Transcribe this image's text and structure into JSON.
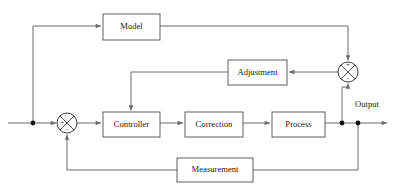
{
  "diagram": {
    "canvas": {
      "width": 399,
      "height": 195,
      "background": "#ffffff"
    },
    "colors": {
      "wire": "#6a6a6a",
      "box_stroke": "#4d4d4d",
      "box_fill": "#ffffff",
      "text": "#1a1a1a",
      "junction_dot": "#111111",
      "circle_stroke": "#3d3d3d"
    },
    "blocks": [
      {
        "id": "model",
        "label": "Model",
        "x": 103,
        "y": 14,
        "w": 57,
        "h": 26
      },
      {
        "id": "adjustment",
        "label": "Adjustment",
        "x": 228,
        "y": 60,
        "w": 59,
        "h": 25
      },
      {
        "id": "controller",
        "label": "Controller",
        "x": 103,
        "y": 112,
        "w": 57,
        "h": 25
      },
      {
        "id": "correction",
        "label": "Correction",
        "x": 185,
        "y": 112,
        "w": 58,
        "h": 25
      },
      {
        "id": "process",
        "label": "Process",
        "x": 272,
        "y": 112,
        "w": 53,
        "h": 25
      },
      {
        "id": "measurement",
        "label": "Measurement",
        "x": 177,
        "y": 158,
        "w": 76,
        "h": 24
      }
    ],
    "summing_junctions": [
      {
        "id": "right-sum",
        "cx": 348,
        "cy": 72,
        "r": 10,
        "signs": [
          {
            "symbol": "+",
            "position": "top",
            "x": 348,
            "y": 65.5
          },
          {
            "symbol": "−",
            "position": "bottom",
            "x": 348,
            "y": 79.0
          }
        ]
      },
      {
        "id": "left-sum",
        "cx": 67,
        "cy": 123,
        "r": 10,
        "signs": [
          {
            "symbol": "+",
            "position": "left",
            "x": 61.5,
            "y": 123
          },
          {
            "symbol": "−",
            "position": "bottom",
            "x": 67,
            "y": 130.0
          }
        ]
      }
    ],
    "labels": [
      {
        "id": "output-label",
        "text": "Output",
        "x": 367,
        "y": 105
      }
    ],
    "junction_dots": [
      {
        "id": "input-branch-dot",
        "cx": 33,
        "cy": 123,
        "r": 2.4
      },
      {
        "id": "output-branch-dot-a",
        "cx": 342,
        "cy": 123,
        "r": 2.4
      },
      {
        "id": "output-branch-dot-b",
        "cx": 358,
        "cy": 123,
        "r": 2.4
      }
    ],
    "connections": [
      {
        "id": "input-to-branch",
        "from": "input",
        "to": "input-branch-dot",
        "arrow": false
      },
      {
        "id": "branch-to-left-sum",
        "from": "input-branch-dot",
        "to": "left-sum",
        "arrow": true
      },
      {
        "id": "branch-up-to-model",
        "from": "input-branch-dot",
        "to": "model",
        "arrow": true
      },
      {
        "id": "model-to-right-sum",
        "from": "model",
        "to": "right-sum",
        "arrow": true,
        "sign": "+"
      },
      {
        "id": "right-sum-to-adjustment",
        "from": "right-sum",
        "to": "adjustment",
        "arrow": true
      },
      {
        "id": "adjustment-to-controller",
        "from": "adjustment",
        "to": "controller",
        "arrow": true
      },
      {
        "id": "left-sum-to-controller",
        "from": "left-sum",
        "to": "controller",
        "arrow": true
      },
      {
        "id": "controller-to-correction",
        "from": "controller",
        "to": "correction",
        "arrow": true
      },
      {
        "id": "correction-to-process",
        "from": "correction",
        "to": "process",
        "arrow": true
      },
      {
        "id": "process-to-output",
        "from": "process",
        "to": "output",
        "arrow": true
      },
      {
        "id": "output-to-right-sum",
        "from": "output-branch-dot-a",
        "to": "right-sum",
        "arrow": true,
        "sign": "−"
      },
      {
        "id": "output-to-measurement",
        "from": "output-branch-dot-b",
        "to": "measurement",
        "arrow": false
      },
      {
        "id": "measurement-to-left-sum",
        "from": "measurement",
        "to": "left-sum",
        "arrow": true,
        "sign": "−"
      }
    ]
  }
}
